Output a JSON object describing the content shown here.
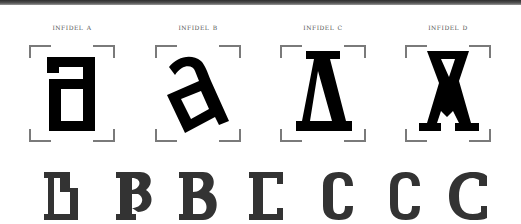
{
  "header": {
    "bar_color": "#3a3a3a"
  },
  "variants": [
    {
      "label": "Infidel a",
      "glyph": "a",
      "center_x": 72
    },
    {
      "label": "Infidel B",
      "glyph": "a-rotated",
      "center_x": 198
    },
    {
      "label": "Infidel C",
      "glyph": "a-delta",
      "center_x": 323
    },
    {
      "label": "Infidel D",
      "glyph": "a-cross",
      "center_x": 448
    }
  ],
  "bottom_row": {
    "glyphs": [
      "B",
      "B",
      "B",
      "C",
      "C",
      "C",
      "C"
    ],
    "color": "#333333"
  },
  "colors": {
    "glyph": "#000000",
    "bracket": "#7a7a7a",
    "label": "#555555",
    "background": "#ffffff"
  }
}
